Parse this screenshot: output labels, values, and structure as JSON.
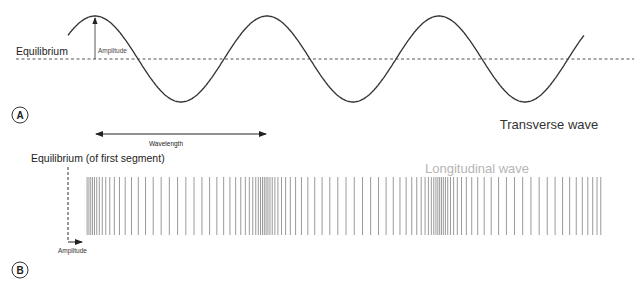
{
  "panel_a": {
    "label": "A",
    "equilibrium_label": "Equilibrium",
    "amplitude_label": "Amplitude",
    "wavelength_label": "Wavelength",
    "title": "Transverse wave",
    "wave": {
      "x_start": 68,
      "x_end": 584,
      "y_center": 59,
      "amplitude": 43,
      "wavelength": 172,
      "first_peak_x": 95
    }
  },
  "panel_b": {
    "label": "B",
    "equilibrium_label": "Equilibrium (of first segment)",
    "amplitude_label": "Amplitude",
    "title": "Longitudinal wave",
    "bars": {
      "x_start": 82,
      "x_end": 600,
      "count": 104,
      "y_top": 177,
      "y_bottom": 235,
      "wavelength": 175,
      "displacement": 18,
      "phase_x": 2.5
    }
  },
  "colors": {
    "wave": "#333333",
    "bars": "#9a9a9a",
    "text": "#222222",
    "title_b": "#b5b5b5"
  }
}
